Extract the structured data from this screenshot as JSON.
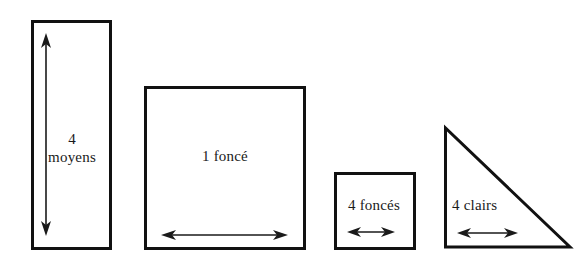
{
  "figure": {
    "background_color": "#ffffff",
    "stroke_color": "#111111",
    "text_color": "#1a1a1a",
    "baseline_y": 248,
    "shapes": [
      {
        "id": "tall-rectangle",
        "kind": "rectangle",
        "label": "4\nmoyens",
        "label_lines": [
          "4",
          "moyens"
        ],
        "arrow": {
          "orientation": "vertical",
          "double_headed": true,
          "from": [
            46,
            36
          ],
          "to": [
            46,
            233
          ]
        },
        "box": {
          "x": 32,
          "y": 21,
          "width": 78,
          "height": 227
        }
      },
      {
        "id": "large-square",
        "kind": "rectangle",
        "label": "1 foncé",
        "label_lines": [
          "1 foncé"
        ],
        "arrow": {
          "orientation": "horizontal",
          "double_headed": true,
          "from": [
            163,
            235
          ],
          "to": [
            286,
            235
          ]
        },
        "box": {
          "x": 145,
          "y": 87,
          "width": 159,
          "height": 161
        }
      },
      {
        "id": "small-square",
        "kind": "rectangle",
        "label": "4 foncés",
        "label_lines": [
          "4 foncés"
        ],
        "arrow": {
          "orientation": "horizontal",
          "double_headed": true,
          "from": [
            349,
            232
          ],
          "to": [
            393,
            232
          ]
        },
        "box": {
          "x": 335,
          "y": 173,
          "width": 79,
          "height": 75
        }
      },
      {
        "id": "right-triangle",
        "kind": "triangle",
        "label": "4 clairs",
        "label_lines": [
          "4 clairs"
        ],
        "arrow": {
          "orientation": "horizontal",
          "double_headed": true,
          "from": [
            459,
            233
          ],
          "to": [
            516,
            233
          ]
        },
        "points": [
          [
            445,
            128
          ],
          [
            445,
            247
          ],
          [
            570,
            247
          ]
        ]
      }
    ]
  }
}
